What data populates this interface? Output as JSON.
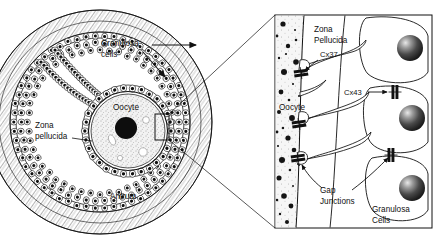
{
  "figure": {
    "colors": {
      "ink": "#111111",
      "line": "#222222",
      "cytoplasm": "#efefef",
      "nucleus": "#101010",
      "paper": "#ffffff",
      "granule": "#151515"
    }
  },
  "follicle_panel": {
    "name": "follicle-cross-section",
    "labels": {
      "granulosa_cells_line1": "Granulosa",
      "granulosa_cells_line2": "cells",
      "oocyte": "Oocyte",
      "zona_pellucida_line1": "Zona",
      "zona_pellucida_line2": "pellucida",
      "antrum": "Antrum"
    }
  },
  "detail_panel": {
    "name": "gap-junction-detail",
    "labels": {
      "oocyte": "Oocyte",
      "zona_pellucida_line1": "Zona",
      "zona_pellucida_line2": "Pellucida",
      "cx37": "Cx37",
      "cx43": "Cx43",
      "gap_junctions_line1": "Gap",
      "gap_junctions_line2": "Junctions",
      "granulosa_cells_line1": "Granulosa",
      "granulosa_cells_line2": "Cells"
    },
    "connexins": [
      "Cx37",
      "Cx43"
    ],
    "gap_junction_count_oocyte_side": 3,
    "gap_junction_count_granulosa_side": 2,
    "granulosa_nuclei": 3
  }
}
